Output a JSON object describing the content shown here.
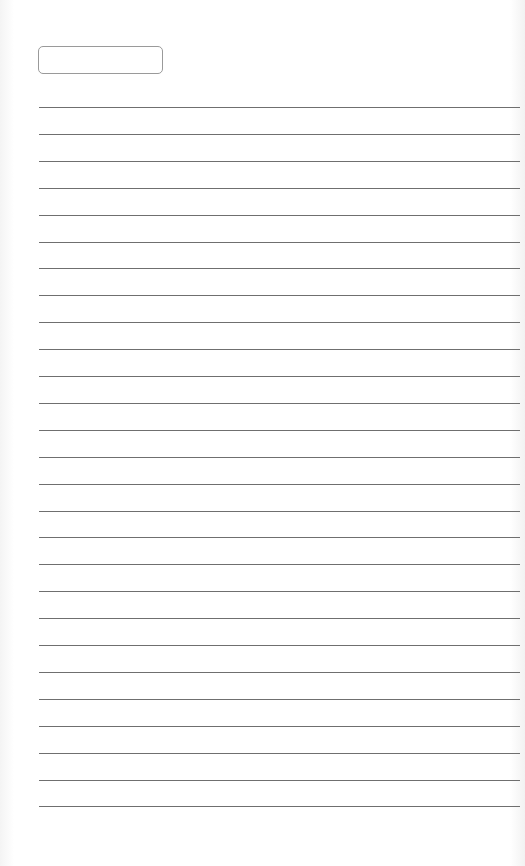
{
  "page": {
    "type": "lined-paper",
    "background_color": "#ffffff",
    "line_color": "#6f6f6f",
    "box_border_color": "#9a9a9a"
  },
  "name_box": {
    "value": ""
  },
  "lines": {
    "count": 27,
    "first_y": 107,
    "spacing": 26.9,
    "items": [
      "",
      "",
      "",
      "",
      "",
      "",
      "",
      "",
      "",
      "",
      "",
      "",
      "",
      "",
      "",
      "",
      "",
      "",
      "",
      "",
      "",
      "",
      "",
      "",
      "",
      "",
      ""
    ]
  }
}
